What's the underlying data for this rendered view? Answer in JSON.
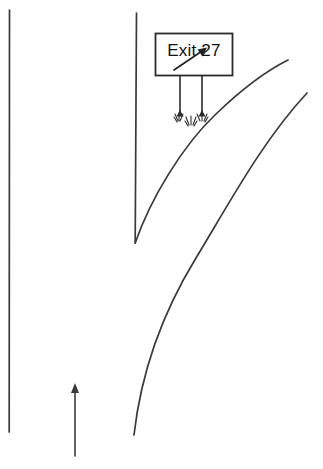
{
  "scene": {
    "title": "Exit 27 highway sign diagram",
    "width": 323,
    "height": 469,
    "background_color": "#ffffff",
    "line_color": "#3a3a3a",
    "ink_color": "#2b2b2b"
  },
  "sign": {
    "label": "Exit 27",
    "panel": {
      "x": 155,
      "y": 33,
      "width": 77,
      "height": 43
    },
    "post_left_x": 179,
    "post_right_x": 202,
    "post_top_y": 76,
    "post_bottom_y": 118,
    "arrow_description": "diagonal arrow pointing up and to the right",
    "arrow_from": [
      176,
      62
    ],
    "arrow_to": [
      206,
      48
    ]
  },
  "roads": {
    "left_shoulder": {
      "name": "left-shoulder-line",
      "from": [
        9,
        10
      ],
      "to": [
        9,
        432
      ]
    },
    "median_edge": {
      "name": "median-edge-line",
      "from": [
        136,
        13
      ],
      "to": [
        136,
        243
      ]
    },
    "inner_ramp_curve": {
      "name": "inner-ramp-curve",
      "from": [
        136,
        243
      ],
      "to": [
        288,
        60
      ]
    },
    "outer_ramp_curve": {
      "name": "outer-ramp-curve",
      "from": [
        134,
        435
      ],
      "to": [
        307,
        93
      ]
    }
  },
  "direction_arrow": {
    "name": "travel-direction-arrow",
    "from": [
      75,
      456
    ],
    "to": [
      75,
      384
    ],
    "points": "up"
  },
  "vegetation": {
    "label": "grass tufts at sign post bases",
    "count": 3
  }
}
